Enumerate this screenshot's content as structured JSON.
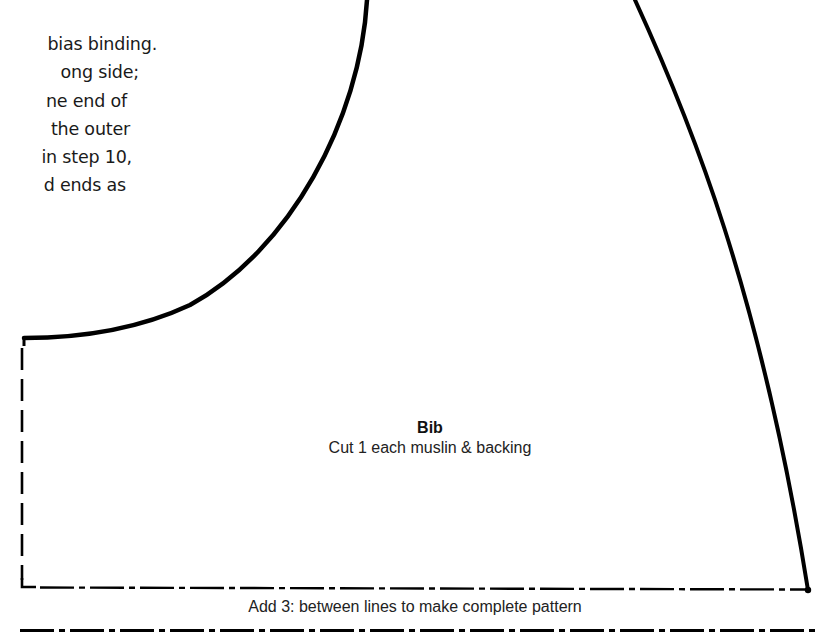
{
  "instructions": {
    "lines": [
      "bias binding.",
      "ong side;",
      "ne end of",
      "the outer",
      "in step 10,",
      "d ends as"
    ]
  },
  "pattern_piece": {
    "name": "Bib",
    "cut_instruction": "Cut 1 each muslin & backing"
  },
  "fold_note": "Add 3: between lines to make complete pattern",
  "colors": {
    "line": "#000000",
    "background": "#ffffff"
  }
}
